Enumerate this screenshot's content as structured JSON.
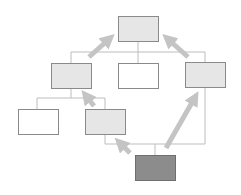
{
  "diagram": {
    "title": "",
    "colors": {
      "background": "#ffffff",
      "box_border": "#8a8a8a",
      "box_fill_light": "#e6e6e6",
      "box_fill_white": "#ffffff",
      "box_fill_dark": "#8c8c8c",
      "connector": "#bdbdbd",
      "arrow": "#c4c4c4"
    },
    "nodes": [
      {
        "id": "top",
        "fill": "light",
        "label": ""
      },
      {
        "id": "mid-left",
        "fill": "light",
        "label": ""
      },
      {
        "id": "mid-center",
        "fill": "white",
        "label": ""
      },
      {
        "id": "mid-right",
        "fill": "light",
        "label": ""
      },
      {
        "id": "low-left",
        "fill": "white",
        "label": ""
      },
      {
        "id": "low-center",
        "fill": "light",
        "label": ""
      },
      {
        "id": "bottom",
        "fill": "dark",
        "label": ""
      }
    ],
    "arrows": [
      {
        "from": "mid-left",
        "to": "top"
      },
      {
        "from": "mid-right",
        "to": "top"
      },
      {
        "from": "low-center",
        "to": "mid-left"
      },
      {
        "from": "bottom",
        "to": "low-center"
      },
      {
        "from": "bottom",
        "to": "mid-right"
      }
    ]
  }
}
